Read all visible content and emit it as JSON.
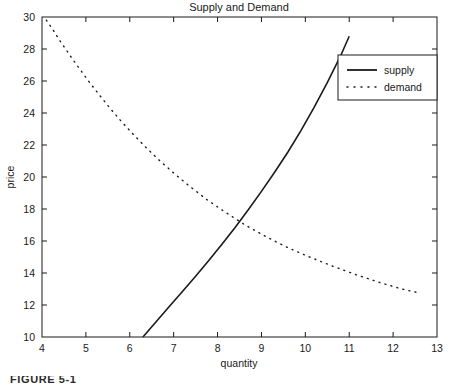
{
  "figure": {
    "caption": "FIGURE 5-1"
  },
  "chart_data": {
    "type": "line",
    "title": "Supply and Demand",
    "xlabel": "quantity",
    "ylabel": "price",
    "xlim": [
      4,
      13
    ],
    "ylim": [
      10,
      30
    ],
    "xticks": [
      4,
      5,
      6,
      7,
      8,
      9,
      10,
      11,
      12,
      13
    ],
    "yticks": [
      10,
      12,
      14,
      16,
      18,
      20,
      22,
      24,
      26,
      28,
      30
    ],
    "xtick_labels": [
      "4",
      "5",
      "6",
      "7",
      "8",
      "9",
      "10",
      "11",
      "12",
      "13"
    ],
    "ytick_labels": [
      "10",
      "12",
      "14",
      "16",
      "18",
      "20",
      "22",
      "24",
      "26",
      "28",
      "30"
    ],
    "grid": false,
    "legend_position": "upper right",
    "legend": [
      "supply",
      "demand"
    ],
    "series": [
      {
        "name": "supply",
        "style": "solid",
        "color": "#1a1a1a",
        "x": [
          6.3,
          6.6,
          6.9,
          7.2,
          7.5,
          7.8,
          8.1,
          8.4,
          8.7,
          9.0,
          9.3,
          9.6,
          9.9,
          10.2,
          10.5,
          10.8,
          11.0
        ],
        "y": [
          10.0,
          10.95,
          11.9,
          12.85,
          13.8,
          14.78,
          15.8,
          16.85,
          17.95,
          19.1,
          20.3,
          21.55,
          22.9,
          24.35,
          25.9,
          27.55,
          28.8
        ]
      },
      {
        "name": "demand",
        "style": "dotted",
        "color": "#1a1a1a",
        "x": [
          4.1,
          4.25,
          4.4,
          4.55,
          4.7,
          4.9,
          5.1,
          5.3,
          5.55,
          5.8,
          6.05,
          6.35,
          6.65,
          7.0,
          7.35,
          7.75,
          8.15,
          8.6,
          9.05,
          9.55,
          10.05,
          10.6,
          11.15,
          11.7,
          12.2,
          12.6
        ],
        "y": [
          29.8,
          29.2,
          28.55,
          27.95,
          27.35,
          26.6,
          25.85,
          25.15,
          24.3,
          23.5,
          22.75,
          21.9,
          21.1,
          20.25,
          19.45,
          18.6,
          17.85,
          17.05,
          16.35,
          15.65,
          15.05,
          14.45,
          13.9,
          13.4,
          13.0,
          12.75
        ]
      }
    ],
    "equilibrium": {
      "quantity": 8.0,
      "price": 15.7
    }
  }
}
